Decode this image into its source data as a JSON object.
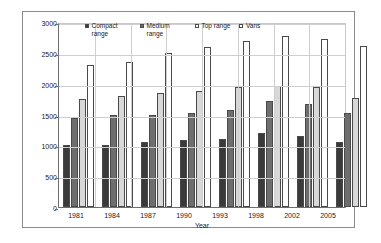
{
  "chart_data": {
    "type": "bar",
    "title": "",
    "xlabel": "Year",
    "ylabel": "Weight [kg]",
    "ylim": [
      0,
      3000
    ],
    "ytick_step": 500,
    "yticks": [
      "3000",
      "2500",
      "2000",
      "1500",
      "1000",
      "500",
      "0"
    ],
    "grid": true,
    "legend_position": "top-inside",
    "categories": [
      "1981",
      "1984",
      "1987",
      "1990",
      "1993",
      "1998",
      "2002",
      "2005"
    ],
    "series": [
      {
        "name": "Compact range",
        "color": "#3a3a3a",
        "values": [
          1000,
          1000,
          1050,
          1080,
          1100,
          1200,
          1150,
          1050
        ]
      },
      {
        "name": "Medium range",
        "color": "#6e6e6e",
        "values": [
          1450,
          1500,
          1500,
          1530,
          1570,
          1720,
          1670,
          1530
        ]
      },
      {
        "name": "Top range",
        "color": "#d8d8d8",
        "values": [
          1750,
          1800,
          1850,
          1880,
          1950,
          1970,
          1950,
          1760
        ]
      },
      {
        "name": "Vans",
        "color": "#ffffff",
        "values": [
          2300,
          2350,
          2500,
          2600,
          2700,
          2780,
          2720,
          2610
        ]
      }
    ]
  }
}
